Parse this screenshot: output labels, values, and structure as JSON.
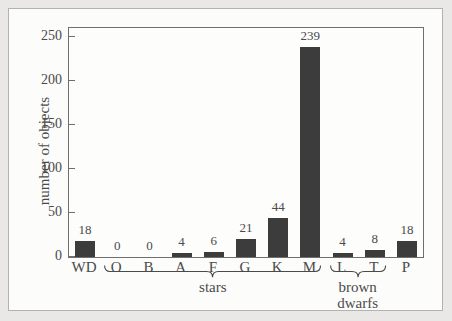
{
  "figure": {
    "colors": {
      "bar": "#3c3c3c",
      "axis": "#6f6f6f",
      "text": "#4a4a4a",
      "frame_border": "#b3b2b0",
      "panel_background": "#fcfcfb",
      "outer_background": "#e9e8e6"
    }
  },
  "chart_data": {
    "type": "bar",
    "title": "",
    "xlabel": "",
    "ylabel": "number of objects",
    "categories": [
      "WD",
      "O",
      "B",
      "A",
      "F",
      "G",
      "K",
      "M",
      "L",
      "T",
      "P"
    ],
    "values": [
      18,
      0,
      0,
      4,
      6,
      21,
      44,
      239,
      4,
      8,
      18
    ],
    "bar_value_labels": [
      "18",
      "0",
      "0",
      "4",
      "6",
      "21",
      "44",
      "239",
      "4",
      "8",
      "18"
    ],
    "yticks": [
      0,
      50,
      100,
      150,
      200,
      250
    ],
    "ylim": [
      0,
      260
    ],
    "grid": false,
    "legend": "none",
    "groups": [
      {
        "label": "stars",
        "from": "O",
        "to": "M"
      },
      {
        "label": "brown dwarfs",
        "from": "L",
        "to": "T"
      }
    ]
  }
}
